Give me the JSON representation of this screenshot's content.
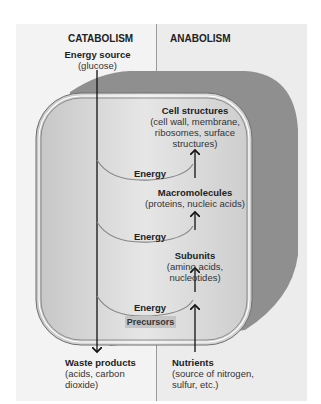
{
  "headers": {
    "left": "CATABOLISM",
    "right": "ANABOLISM"
  },
  "energy_source": {
    "title": "Energy source",
    "detail": "(glucose)"
  },
  "cell_structures": {
    "title": "Cell structures",
    "detail": [
      "(cell wall, membrane,",
      "ribosomes, surface",
      "structures)"
    ]
  },
  "macromolecules": {
    "title": "Macromolecules",
    "detail": "(proteins, nucleic acids)"
  },
  "subunits": {
    "title": "Subunits",
    "detail": [
      "(amino acids,",
      "nucleotides)"
    ]
  },
  "energy_labels": [
    "Energy",
    "Energy",
    "Energy"
  ],
  "precursors": "Precursors",
  "waste": {
    "title": "Waste products",
    "detail": [
      "(acids, carbon",
      "dioxide)"
    ]
  },
  "nutrients": {
    "title": "Nutrients",
    "detail": [
      "(source of nitrogen,",
      "sulfur, etc.)"
    ]
  },
  "colors": {
    "cell_outer": "#8f8f8f",
    "cell_inner": "#cfcfcf",
    "precursor_box": "#c4c4c4"
  }
}
